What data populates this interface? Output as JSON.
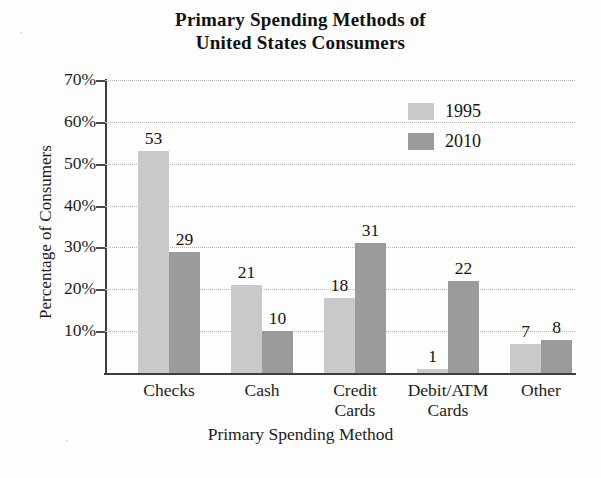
{
  "chart_data": {
    "type": "bar",
    "title": "Primary Spending Methods of United States Consumers",
    "title_lines": [
      "Primary Spending Methods of",
      "United States Consumers"
    ],
    "xlabel": "Primary Spending Method",
    "ylabel": "Percentage of Consumers",
    "categories": [
      "Checks",
      "Cash",
      "Credit Cards",
      "Debit/ATM Cards",
      "Other"
    ],
    "category_lines": [
      [
        "Checks",
        ""
      ],
      [
        "Cash",
        ""
      ],
      [
        "Credit",
        "Cards"
      ],
      [
        "Debit/ATM",
        "Cards"
      ],
      [
        "Other",
        ""
      ]
    ],
    "series": [
      {
        "name": "1995",
        "color": "#c9c9c9",
        "values": [
          53,
          21,
          18,
          1,
          7
        ]
      },
      {
        "name": "2010",
        "color": "#9b9b9b",
        "values": [
          29,
          10,
          31,
          22,
          8
        ]
      }
    ],
    "ylim": [
      0,
      70
    ],
    "yticks": [
      10,
      20,
      30,
      40,
      50,
      60,
      70
    ],
    "ytick_labels": [
      "10%",
      "20%",
      "30%",
      "40%",
      "50%",
      "60%",
      "70%"
    ],
    "grid": true,
    "legend_position": "upper-right",
    "value_labels_shown": true,
    "value_label_suffix": ""
  },
  "legend": {
    "items": [
      {
        "label": "1995",
        "color": "#c9c9c9"
      },
      {
        "label": "2010",
        "color": "#9b9b9b"
      }
    ]
  },
  "colors": {
    "series_1995": "#c9c9c9",
    "series_2010": "#9b9b9b",
    "axis": "#3d3d3d",
    "grid": "#b9b9b9",
    "text": "#1c1c1c",
    "background": "#fdfdfd"
  }
}
